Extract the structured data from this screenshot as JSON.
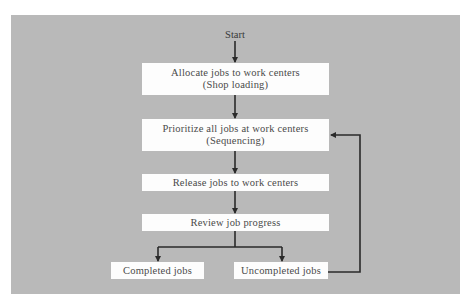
{
  "diagram": {
    "type": "flowchart",
    "start_label": "Start",
    "nodes": [
      {
        "id": "allocate",
        "line1": "Allocate jobs to work centers",
        "line2": "(Shop loading)"
      },
      {
        "id": "prioritize",
        "line1": "Prioritize all jobs at work centers",
        "line2": "(Sequencing)"
      },
      {
        "id": "release",
        "line1": "Release jobs to work centers"
      },
      {
        "id": "review",
        "line1": "Review job progress"
      },
      {
        "id": "completed",
        "line1": "Completed jobs"
      },
      {
        "id": "uncompleted",
        "line1": "Uncompleted jobs"
      }
    ],
    "edges": [
      {
        "from": "start",
        "to": "allocate"
      },
      {
        "from": "allocate",
        "to": "prioritize"
      },
      {
        "from": "prioritize",
        "to": "release"
      },
      {
        "from": "release",
        "to": "review"
      },
      {
        "from": "review",
        "to": "completed"
      },
      {
        "from": "review",
        "to": "uncompleted"
      },
      {
        "from": "uncompleted",
        "to": "prioritize"
      }
    ],
    "colors": {
      "background": "#b9b9b9",
      "box": "#fdfdfd",
      "line": "#2a2a2a",
      "text": "#4a4a4a"
    }
  }
}
